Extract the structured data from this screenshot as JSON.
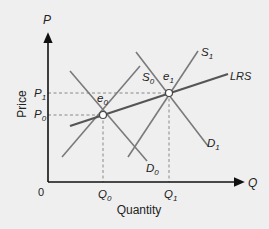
{
  "diagram": {
    "y_axis": {
      "symbol": "P",
      "title": "Price"
    },
    "x_axis": {
      "symbol": "Q",
      "title": "Quantity"
    },
    "origin": "0",
    "price_ticks": [
      {
        "label": "P",
        "sub": "1"
      },
      {
        "label": "P",
        "sub": "0"
      }
    ],
    "quantity_ticks": [
      {
        "label": "Q",
        "sub": "0"
      },
      {
        "label": "Q",
        "sub": "1"
      }
    ],
    "equilibria": [
      {
        "label": "e",
        "sub": "0"
      },
      {
        "label": "e",
        "sub": "1"
      }
    ],
    "curves": {
      "s0": {
        "label": "S",
        "sub": "0"
      },
      "s1": {
        "label": "S",
        "sub": "1"
      },
      "d0": {
        "label": "D",
        "sub": "0"
      },
      "d1": {
        "label": "D",
        "sub": "1"
      },
      "lrs": {
        "label": "LRS"
      }
    },
    "colors": {
      "background": "#efefef",
      "axis": "#111111",
      "curve": "#7a7a7a",
      "lrs": "#555555",
      "dashed": "#888888"
    }
  }
}
